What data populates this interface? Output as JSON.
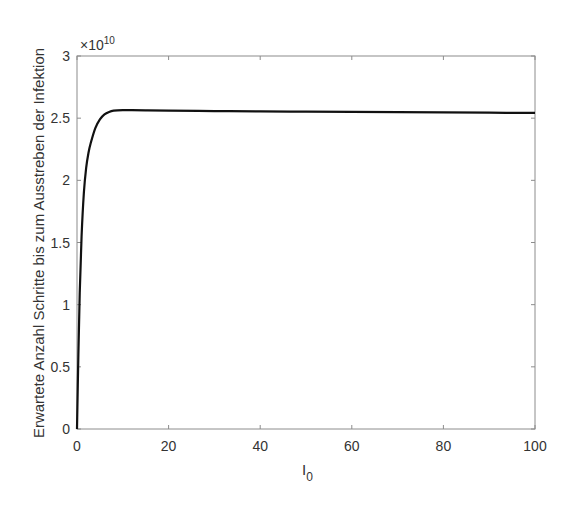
{
  "chart_data": {
    "type": "line",
    "title": "",
    "xlabel": "I",
    "xlabel_subscript": "0",
    "ylabel": "Erwartete Anzahl Schritte bis zum Ausstreben der Infektion",
    "y_exponent_label": "×10",
    "y_exponent_power": "10",
    "xlim": [
      0,
      100
    ],
    "ylim": [
      0,
      3
    ],
    "x_ticks": [
      0,
      20,
      40,
      60,
      80,
      100
    ],
    "x_tick_labels": [
      "0",
      "20",
      "40",
      "60",
      "80",
      "100"
    ],
    "y_ticks": [
      0,
      0.5,
      1,
      1.5,
      2,
      2.5,
      3
    ],
    "y_tick_labels": [
      "0",
      "0.5",
      "1",
      "1.5",
      "2",
      "2.5",
      "3"
    ],
    "grid": false,
    "legend": null,
    "series": [
      {
        "name": "Erwartete Schritte",
        "color": "#111111",
        "x": [
          0,
          0.3,
          0.6,
          1,
          1.5,
          2,
          2.5,
          3,
          4,
          5,
          6,
          7,
          8,
          10,
          12,
          15,
          20,
          30,
          40,
          50,
          60,
          70,
          80,
          90,
          100
        ],
        "y": [
          0,
          0.6,
          1.1,
          1.55,
          1.9,
          2.1,
          2.22,
          2.3,
          2.42,
          2.49,
          2.53,
          2.55,
          2.56,
          2.565,
          2.565,
          2.563,
          2.56,
          2.557,
          2.554,
          2.552,
          2.55,
          2.548,
          2.546,
          2.544,
          2.542
        ]
      }
    ]
  }
}
